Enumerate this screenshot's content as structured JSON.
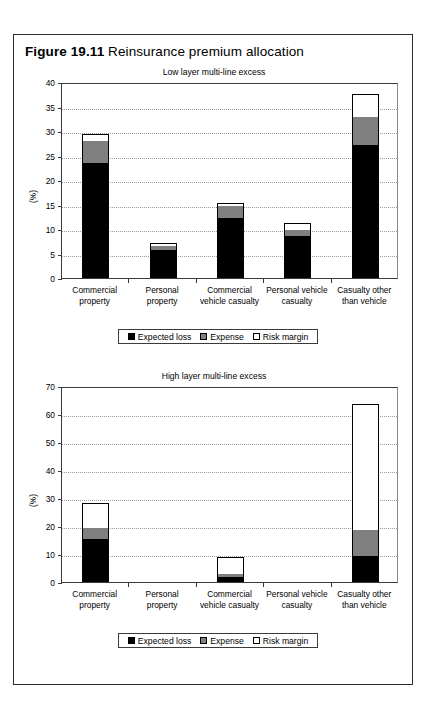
{
  "figure": {
    "number": "Figure 19.11",
    "caption": "Reinsurance premium allocation"
  },
  "legend": {
    "items": [
      {
        "label": "Expected loss",
        "key": "expected_loss",
        "color": "#000000",
        "swatch": "filled-black-square-icon"
      },
      {
        "label": "Expense",
        "key": "expense",
        "color": "#808080",
        "swatch": "filled-gray-square-icon"
      },
      {
        "label": "Risk margin",
        "key": "risk_margin",
        "color": "#ffffff",
        "swatch": "outlined-white-square-icon"
      }
    ]
  },
  "chart_data": [
    {
      "id": "low-layer",
      "type": "bar",
      "stacked": true,
      "title": "Low layer multi-line excess",
      "xlabel": "",
      "ylabel": "(%)",
      "ylim": [
        0,
        40
      ],
      "yticks": [
        0,
        5,
        10,
        15,
        20,
        25,
        30,
        35,
        40
      ],
      "ytick_labels": [
        "0",
        "5",
        "10",
        "15",
        "20",
        "25",
        "30",
        "35",
        "40"
      ],
      "grid": true,
      "legend_position": "below",
      "categories": [
        "Commercial property",
        "Personal property",
        "Commercial vehicle casualty",
        "Personal vehicle casualty",
        "Casualty other than vehicle"
      ],
      "category_lines": [
        [
          "Commercial",
          "property"
        ],
        [
          "Personal",
          "property"
        ],
        [
          "Commercial",
          "vehicle casualty"
        ],
        [
          "Personal vehicle",
          "casualty"
        ],
        [
          "Casualty other",
          "than vehicle"
        ]
      ],
      "series": [
        {
          "name": "Expected loss",
          "color": "#000000",
          "values": [
            23.5,
            5.7,
            12.3,
            8.6,
            27.2
          ]
        },
        {
          "name": "Expense",
          "color": "#808080",
          "values": [
            4.5,
            0.9,
            2.4,
            1.2,
            5.6
          ]
        },
        {
          "name": "Risk margin",
          "color": "#ffffff",
          "values": [
            1.3,
            0.6,
            0.6,
            1.4,
            4.8
          ]
        }
      ],
      "totals": [
        29.3,
        7.2,
        15.3,
        11.2,
        37.6
      ]
    },
    {
      "id": "high-layer",
      "type": "bar",
      "stacked": true,
      "title": "High layer multi-line excess",
      "xlabel": "",
      "ylabel": "(%)",
      "ylim": [
        0,
        70
      ],
      "yticks": [
        0,
        10,
        20,
        30,
        40,
        50,
        60,
        70
      ],
      "ytick_labels": [
        "0",
        "10",
        "20",
        "30",
        "40",
        "50",
        "60",
        "70"
      ],
      "grid": true,
      "legend_position": "below",
      "categories": [
        "Commercial property",
        "Personal property",
        "Commercial vehicle casualty",
        "Personal vehicle casualty",
        "Casualty other than vehicle"
      ],
      "category_lines": [
        [
          "Commercial",
          "property"
        ],
        [
          "Personal",
          "property"
        ],
        [
          "Commercial",
          "vehicle casualty"
        ],
        [
          "Personal vehicle",
          "casualty"
        ],
        [
          "Casualty other",
          "than vehicle"
        ]
      ],
      "series": [
        {
          "name": "Expected loss",
          "color": "#000000",
          "values": [
            15.2,
            0,
            1.8,
            0,
            9.3
          ]
        },
        {
          "name": "Expense",
          "color": "#808080",
          "values": [
            4.2,
            0,
            0.9,
            0,
            9.4
          ]
        },
        {
          "name": "Risk margin",
          "color": "#ffffff",
          "values": [
            8.9,
            0,
            6.2,
            0,
            45.0
          ]
        }
      ],
      "totals": [
        28.3,
        0,
        8.9,
        0,
        63.7
      ]
    }
  ]
}
